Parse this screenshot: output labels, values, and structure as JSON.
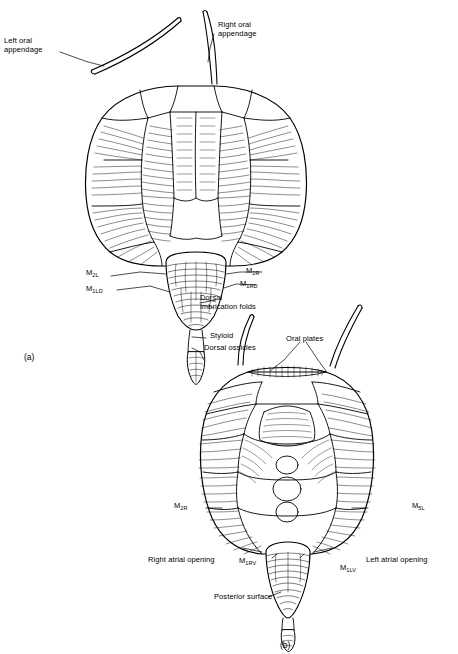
{
  "figure": {
    "type": "scientific-line-drawing",
    "panels": [
      {
        "id": "a",
        "label": "(a)",
        "view": "dorsal"
      },
      {
        "id": "b",
        "label": "(b)",
        "view": "ventral"
      }
    ],
    "labels_panel_a": [
      {
        "name": "left-oral-appendage",
        "text": "Left oral\nappendage"
      },
      {
        "name": "right-oral-appendage",
        "text": "Right oral\nappendage"
      },
      {
        "name": "m2l",
        "text": "M2L",
        "base": "M",
        "sub": "2L"
      },
      {
        "name": "m1ld",
        "text": "M1LD",
        "base": "M",
        "sub": "1LD"
      },
      {
        "name": "m2r",
        "text": "M2R",
        "base": "M",
        "sub": "2R"
      },
      {
        "name": "m1rd",
        "text": "M1RD",
        "base": "M",
        "sub": "1RD"
      },
      {
        "name": "dorsal-imbrication-folds",
        "text": "Dorsal\nimbrication folds"
      },
      {
        "name": "styloid",
        "text": "Styloid"
      },
      {
        "name": "dorsal-ossicles",
        "text": "Dorsal ossicles"
      }
    ],
    "labels_panel_b": [
      {
        "name": "oral-plates",
        "text": "Oral plates"
      },
      {
        "name": "m2r",
        "text": "M2R",
        "base": "M",
        "sub": "2R"
      },
      {
        "name": "m5l",
        "text": "M5L",
        "base": "M",
        "sub": "5L"
      },
      {
        "name": "right-atrial-opening",
        "text": "Right atrial opening"
      },
      {
        "name": "m1rv",
        "text": "M1RV",
        "base": "M",
        "sub": "1RV"
      },
      {
        "name": "m1lv",
        "text": "M1LV",
        "base": "M",
        "sub": "1LV"
      },
      {
        "name": "left-atrial-opening",
        "text": "Left atrial opening"
      },
      {
        "name": "posterior-surface",
        "text": "Posterior surface"
      }
    ],
    "colors": {
      "line": "#000000",
      "background": "#ffffff",
      "shading": "#555555"
    }
  }
}
